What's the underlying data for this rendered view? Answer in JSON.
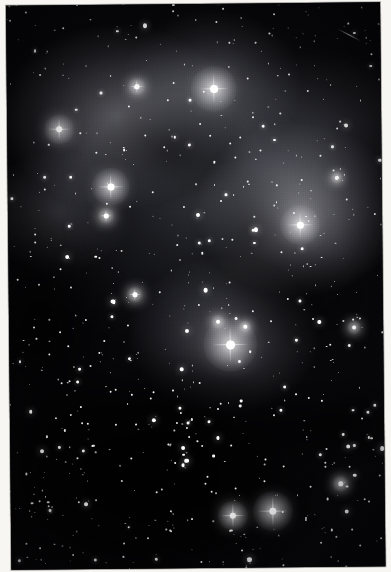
{
  "image": {
    "kind": "astronomical-photograph",
    "title": "Deep sky star field with reflection nebulosity",
    "width": 391,
    "height": 572,
    "orientation": "portrait",
    "medium": "scanned photographic print",
    "caption": ""
  },
  "palette": {
    "sky_background": "#07070a",
    "paper_margin": "#f7f6f2",
    "star_core": "#ffffff",
    "nebula_glow": "#b4b4ba",
    "dust_lane": "#000000",
    "frame_border": "#050507"
  },
  "frame": {
    "photo_left": 6,
    "photo_top": 4,
    "photo_width": 374,
    "photo_height": 564,
    "skew_degrees": -0.55
  },
  "features": {
    "nebula_regions": [
      {
        "name": "upper-left-glow",
        "cx": 120,
        "cy": 120,
        "rx": 150,
        "ry": 120,
        "intensity": 0.5
      },
      {
        "name": "right-bright-lobe",
        "cx": 300,
        "cy": 215,
        "rx": 130,
        "ry": 110,
        "intensity": 0.6
      },
      {
        "name": "top-central-glow",
        "cx": 215,
        "cy": 90,
        "rx": 110,
        "ry": 95,
        "intensity": 0.42
      },
      {
        "name": "central-halo-glow",
        "cx": 225,
        "cy": 340,
        "rx": 120,
        "ry": 100,
        "intensity": 0.45
      },
      {
        "name": "left-mid-glow",
        "cx": 60,
        "cy": 215,
        "rx": 95,
        "ry": 80,
        "intensity": 0.34
      },
      {
        "name": "upper-right-haze",
        "cx": 330,
        "cy": 130,
        "rx": 150,
        "ry": 90,
        "intensity": 0.26
      }
    ],
    "dust_lanes": [
      {
        "name": "lower-dark-field",
        "cx": 150,
        "cy": 480,
        "rx": 230,
        "ry": 150,
        "opacity": 0.92
      },
      {
        "name": "left-dark-column",
        "cx": 40,
        "cy": 330,
        "rx": 120,
        "ry": 180,
        "opacity": 0.8
      },
      {
        "name": "mid-dark-patch",
        "cx": 175,
        "cy": 155,
        "rx": 100,
        "ry": 70,
        "opacity": 0.55
      },
      {
        "name": "right-dark-patch",
        "cx": 300,
        "cy": 300,
        "rx": 95,
        "ry": 65,
        "opacity": 0.5
      },
      {
        "name": "lower-right-dark",
        "cx": 330,
        "cy": 430,
        "rx": 110,
        "ry": 60,
        "opacity": 0.7
      }
    ],
    "bright_stars": [
      {
        "name": "star-north-central",
        "x": 207,
        "y": 85,
        "size": 7.5,
        "halo": 46,
        "spikes": 30,
        "label": "bright star with circular halo"
      },
      {
        "name": "star-west-mid",
        "x": 103,
        "y": 182,
        "size": 6.5,
        "halo": 38,
        "spikes": 26,
        "label": "bright star in nebulosity"
      },
      {
        "name": "star-east-mid",
        "x": 292,
        "y": 222,
        "size": 6.5,
        "halo": 40,
        "spikes": 26,
        "label": "bright star in east lobe"
      },
      {
        "name": "star-central-bright",
        "x": 221,
        "y": 341,
        "size": 8.5,
        "halo": 54,
        "spikes": 36,
        "label": "brightest star, large halo"
      },
      {
        "name": "star-northwest",
        "x": 52,
        "y": 124,
        "size": 6.0,
        "halo": 30,
        "spikes": 22,
        "label": "bright star upper left"
      },
      {
        "name": "star-south-pair-a",
        "x": 222,
        "y": 512,
        "size": 6.0,
        "halo": 30,
        "spikes": 24,
        "label": "southern bright pair, west"
      },
      {
        "name": "star-south-pair-b",
        "x": 262,
        "y": 508,
        "size": 7.0,
        "halo": 40,
        "spikes": 30,
        "label": "southern bright pair, east"
      },
      {
        "name": "star-north-small",
        "x": 130,
        "y": 82,
        "size": 4.5,
        "halo": 18,
        "spikes": 14,
        "label": "medium star top"
      },
      {
        "name": "star-west-low",
        "x": 98,
        "y": 211,
        "size": 4.5,
        "halo": 16,
        "spikes": 12,
        "label": "medium star left"
      },
      {
        "name": "star-central-near",
        "x": 209,
        "y": 318,
        "size": 4.0,
        "halo": 14,
        "spikes": 0,
        "label": "companion star"
      },
      {
        "name": "star-central-near2",
        "x": 236,
        "y": 323,
        "size": 3.5,
        "halo": 12,
        "spikes": 0,
        "label": "companion star"
      },
      {
        "name": "star-southeast",
        "x": 345,
        "y": 325,
        "size": 4.0,
        "halo": 14,
        "spikes": 0,
        "label": "medium star right"
      },
      {
        "name": "star-south-far",
        "x": 126,
        "y": 290,
        "size": 4.5,
        "halo": 16,
        "spikes": 12,
        "label": "medium star lower left"
      },
      {
        "name": "star-northeast",
        "x": 329,
        "y": 175,
        "size": 3.5,
        "halo": 12,
        "spikes": 0,
        "label": "medium star"
      },
      {
        "name": "star-bottom-right",
        "x": 330,
        "y": 481,
        "size": 4.5,
        "halo": 16,
        "spikes": 0,
        "label": "medium star bottom right"
      }
    ],
    "artifacts": [
      {
        "name": "satellite-trail",
        "x": 340,
        "y": 40,
        "length": 26,
        "angle": 28
      }
    ],
    "star_field": {
      "approximate_count": 780,
      "distribution": "dense, concentrated toward lower half",
      "note": "Thousands of point sources of varying magnitude across the frame"
    }
  }
}
